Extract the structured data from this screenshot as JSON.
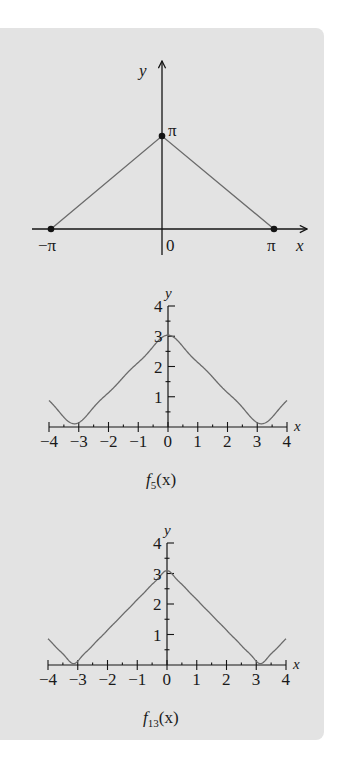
{
  "chart_data": [
    {
      "type": "line",
      "title": "",
      "xlabel": "x",
      "ylabel": "y",
      "description": "Triangle function f(x) = π − |x| on [−π, π]",
      "x": [
        -3.14159,
        0,
        3.14159
      ],
      "values": [
        0,
        3.14159,
        0
      ],
      "tick_labels_x": [
        "−π",
        "0",
        "π"
      ],
      "tick_labels_y": [
        "π"
      ],
      "points_marked": [
        {
          "x": -3.14159,
          "y": 0,
          "label": "−π"
        },
        {
          "x": 0,
          "y": 3.14159,
          "label": "π"
        },
        {
          "x": 3.14159,
          "y": 0,
          "label": "π"
        }
      ],
      "grid": false
    },
    {
      "type": "line",
      "title": "f5(x)",
      "caption_main": "f",
      "caption_sub": "5",
      "caption_tail": "(x)",
      "xlabel": "x",
      "ylabel": "y",
      "description": "Fourier partial sum π/2 + (4/π)Σ cos(kx)/k², odd k ≤ 5",
      "n_terms": 5,
      "xlim": [
        -4,
        4
      ],
      "ylim": [
        0,
        4
      ],
      "x": [
        -4,
        -3,
        -2,
        -1,
        0,
        1,
        2,
        3,
        4
      ],
      "values": [
        0.92,
        0.09,
        1.15,
        2.14,
        2.98,
        2.14,
        1.15,
        0.09,
        0.92
      ],
      "tick_labels_x": [
        "−4",
        "−3",
        "−2",
        "−1",
        "0",
        "1",
        "2",
        "3",
        "4"
      ],
      "tick_labels_y": [
        "1",
        "2",
        "3",
        "4"
      ],
      "grid": false
    },
    {
      "type": "line",
      "title": "f13(x)",
      "caption_main": "f",
      "caption_sub": "13",
      "caption_tail": "(x)",
      "xlabel": "x",
      "ylabel": "y",
      "description": "Fourier partial sum π/2 + (4/π)Σ cos(kx)/k², odd k ≤ 13",
      "n_terms": 13,
      "xlim": [
        -4,
        4
      ],
      "ylim": [
        0,
        4
      ],
      "x": [
        -4,
        -3,
        -2,
        -1,
        0,
        1,
        2,
        3,
        4
      ],
      "values": [
        0.88,
        0.15,
        1.14,
        2.14,
        3.05,
        2.14,
        1.14,
        0.15,
        0.88
      ],
      "tick_labels_x": [
        "−4",
        "−3",
        "−2",
        "−1",
        "0",
        "1",
        "2",
        "3",
        "4"
      ],
      "tick_labels_y": [
        "1",
        "2",
        "3",
        "4"
      ],
      "grid": false
    }
  ],
  "colors": {
    "panel_bg": "#e3e3e3",
    "axis": "#141414",
    "curve": "#6b6b6b",
    "text": "#1a1a1a"
  },
  "graph1": {
    "y_label": "y",
    "x_label": "x",
    "peak_label": "π",
    "neg_pi_label": "−π",
    "origin_label": "0",
    "pi_label": "π"
  },
  "graph2": {
    "y_label": "y",
    "x_label": "x",
    "caption_f": "f",
    "caption_sub": "5",
    "caption_tail": "(x)",
    "x_ticks": [
      "−4",
      "−3",
      "−2",
      "−1",
      "0",
      "1",
      "2",
      "3",
      "4"
    ],
    "y_ticks": [
      "1",
      "2",
      "3",
      "4"
    ]
  },
  "graph3": {
    "y_label": "y",
    "x_label": "x",
    "caption_f": "f",
    "caption_sub": "13",
    "caption_tail": "(x)",
    "x_ticks": [
      "−4",
      "−3",
      "−2",
      "−1",
      "0",
      "1",
      "2",
      "3",
      "4"
    ],
    "y_ticks": [
      "1",
      "2",
      "3",
      "4"
    ]
  }
}
